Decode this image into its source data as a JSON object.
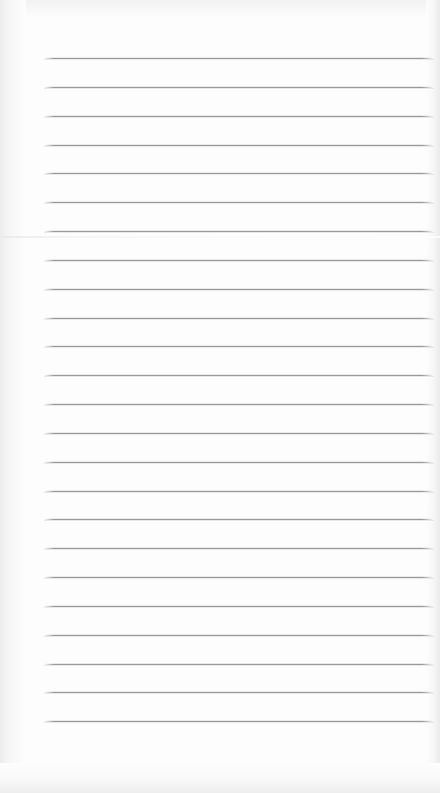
{
  "document": {
    "kind": "lined-notebook-page",
    "title": "Blank ruled notebook page",
    "page_width": 440,
    "page_height": 793,
    "background_color": "#fdfdfd",
    "rule_color": "#8c8c92",
    "text_content": "",
    "ruling": {
      "line_count": 24,
      "first_line_y": 58,
      "line_spacing": 28.85,
      "line_left_x": 44,
      "line_right_x": 434,
      "line_thickness": 1,
      "margin_line": false,
      "header_space_top": 58,
      "footer_space_bottom": 71
    },
    "scan_artifacts": {
      "seam_y": 236,
      "edge_shading": true,
      "left_margin_shade_width": 26,
      "right_margin_shade_width": 14
    },
    "lines": [
      {
        "index": 1,
        "y": 58,
        "text": ""
      },
      {
        "index": 2,
        "y": 87,
        "text": ""
      },
      {
        "index": 3,
        "y": 116,
        "text": ""
      },
      {
        "index": 4,
        "y": 145,
        "text": ""
      },
      {
        "index": 5,
        "y": 173,
        "text": ""
      },
      {
        "index": 6,
        "y": 202,
        "text": ""
      },
      {
        "index": 7,
        "y": 231,
        "text": ""
      },
      {
        "index": 8,
        "y": 260,
        "text": ""
      },
      {
        "index": 9,
        "y": 289,
        "text": ""
      },
      {
        "index": 10,
        "y": 318,
        "text": ""
      },
      {
        "index": 11,
        "y": 346,
        "text": ""
      },
      {
        "index": 12,
        "y": 375,
        "text": ""
      },
      {
        "index": 13,
        "y": 404,
        "text": ""
      },
      {
        "index": 14,
        "y": 433,
        "text": ""
      },
      {
        "index": 15,
        "y": 462,
        "text": ""
      },
      {
        "index": 16,
        "y": 491,
        "text": ""
      },
      {
        "index": 17,
        "y": 519,
        "text": ""
      },
      {
        "index": 18,
        "y": 548,
        "text": ""
      },
      {
        "index": 19,
        "y": 577,
        "text": ""
      },
      {
        "index": 20,
        "y": 606,
        "text": ""
      },
      {
        "index": 21,
        "y": 635,
        "text": ""
      },
      {
        "index": 22,
        "y": 664,
        "text": ""
      },
      {
        "index": 23,
        "y": 692,
        "text": ""
      },
      {
        "index": 24,
        "y": 721,
        "text": ""
      }
    ]
  }
}
